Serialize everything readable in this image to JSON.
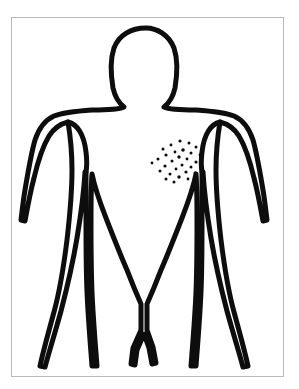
{
  "diagram": {
    "view": "anterior",
    "caption": "Front view body outline with a cluster of small dots marking a skin lesion area on the chest",
    "background_color": "#ffffff",
    "ink_color": "#0d0d0d",
    "frame_color": "#b9b9b9",
    "frame": {
      "x": 11,
      "y": 17,
      "width": 273,
      "height": 360
    },
    "parts": [
      {
        "name": "head",
        "label": "Head"
      },
      {
        "name": "neck",
        "label": "Neck"
      },
      {
        "name": "left-shoulder",
        "label": "Left shoulder"
      },
      {
        "name": "right-shoulder",
        "label": "Right shoulder"
      },
      {
        "name": "left-arm",
        "label": "Left arm"
      },
      {
        "name": "right-arm",
        "label": "Right arm"
      },
      {
        "name": "torso",
        "label": "Torso"
      },
      {
        "name": "left-leg",
        "label": "Left leg"
      },
      {
        "name": "right-leg",
        "label": "Right leg"
      }
    ],
    "outline_path": "M 146 28 C 131 28 119 35 114 48 C 110 60 111 76 113 88 C 115 97 119 103 124 107 C 118 110 105 110 92 110 C 78 111 64 112 54 116 C 45 120 39 128 35 140 C 31 154 28 172 25 190 C 23 202 22 212 21 220 L 25 221 C 27 210 30 193 34 178 C 38 161 43 146 49 136 C 54 128 60 124 68 122 C 70 134 72 153 72 170 C 72 186 70 214 67 240 C 64 264 60 290 54 312 C 48 334 43 352 40 366 L 45 367 C 49 352 55 333 61 311 C 67 288 73 262 77 238 C 81 214 84 190 85 172 L 86 172 C 86 188 86 206 86 222 C 86 244 86 268 87 292 C 88 316 90 340 92 366 L 97 366 C 95 340 93 316 92 292 C 91 268 91 244 91 222 C 91 204 91 186 92 174 C 94 184 99 200 106 218 C 113 236 120 254 127 270 C 132 283 137 295 141 304 L 141 330 L 133 348 L 131 364 L 135 365 L 137 350 L 144 334 L 149 348 L 152 364 L 156 363 L 153 347 L 147 330 L 147 304 C 151 295 156 283 161 270 C 168 254 175 236 182 218 C 189 200 194 184 196 174 C 197 186 197 204 197 222 C 197 244 197 268 196 292 C 195 316 193 340 191 366 L 196 366 C 198 340 200 316 201 292 C 202 268 202 244 202 222 C 202 206 202 188 202 172 L 203 172 C 204 190 207 214 211 238 C 215 262 221 288 227 311 C 233 333 239 352 243 367 L 248 366 C 245 352 240 334 234 312 C 228 290 224 264 221 240 C 218 214 216 186 216 170 C 216 153 218 134 220 122 C 228 124 234 128 239 136 C 245 146 250 161 254 178 C 258 193 261 210 263 221 L 267 220 C 266 212 265 202 263 190 C 260 172 257 154 253 140 C 249 128 243 120 234 116 C 224 112 210 111 196 110 C 183 110 170 110 164 107 C 169 103 173 97 175 88 C 177 76 178 60 174 48 C 169 35 157 28 146 28 Z",
    "armpit_left_path": "M 68 122 C 77 124 84 134 86 152 C 87 160 87 166 86 172",
    "armpit_right_path": "M 220 122 C 211 124 204 134 202 152 C 201 160 201 166 202 172",
    "lesion_cluster": {
      "name": "chest-lesion-cluster",
      "label": "Dotted lesion area on chest",
      "region": "left chest / pectoral",
      "center_x": 177,
      "center_y": 161,
      "radius_x": 26,
      "radius_y": 22,
      "dot_count": 28,
      "dots": [
        {
          "x": 180,
          "y": 141,
          "r": 1.6
        },
        {
          "x": 189,
          "y": 143,
          "r": 1.5
        },
        {
          "x": 171,
          "y": 145,
          "r": 1.4
        },
        {
          "x": 196,
          "y": 147,
          "r": 1.5
        },
        {
          "x": 163,
          "y": 149,
          "r": 1.5
        },
        {
          "x": 183,
          "y": 150,
          "r": 1.8
        },
        {
          "x": 175,
          "y": 152,
          "r": 1.4
        },
        {
          "x": 191,
          "y": 153,
          "r": 1.5
        },
        {
          "x": 166,
          "y": 155,
          "r": 1.6
        },
        {
          "x": 200,
          "y": 155,
          "r": 1.4
        },
        {
          "x": 179,
          "y": 157,
          "r": 1.7
        },
        {
          "x": 187,
          "y": 159,
          "r": 1.4
        },
        {
          "x": 158,
          "y": 159,
          "r": 1.5
        },
        {
          "x": 172,
          "y": 161,
          "r": 1.5
        },
        {
          "x": 196,
          "y": 162,
          "r": 1.6
        },
        {
          "x": 152,
          "y": 163,
          "r": 1.4
        },
        {
          "x": 182,
          "y": 165,
          "r": 1.5
        },
        {
          "x": 165,
          "y": 166,
          "r": 1.6
        },
        {
          "x": 191,
          "y": 167,
          "r": 1.5
        },
        {
          "x": 176,
          "y": 169,
          "r": 1.4
        },
        {
          "x": 160,
          "y": 171,
          "r": 1.5
        },
        {
          "x": 186,
          "y": 172,
          "r": 1.6
        },
        {
          "x": 170,
          "y": 174,
          "r": 1.5
        },
        {
          "x": 195,
          "y": 173,
          "r": 1.4
        },
        {
          "x": 179,
          "y": 177,
          "r": 1.7
        },
        {
          "x": 166,
          "y": 179,
          "r": 1.5
        },
        {
          "x": 188,
          "y": 179,
          "r": 1.4
        },
        {
          "x": 174,
          "y": 182,
          "r": 1.5
        }
      ]
    }
  }
}
